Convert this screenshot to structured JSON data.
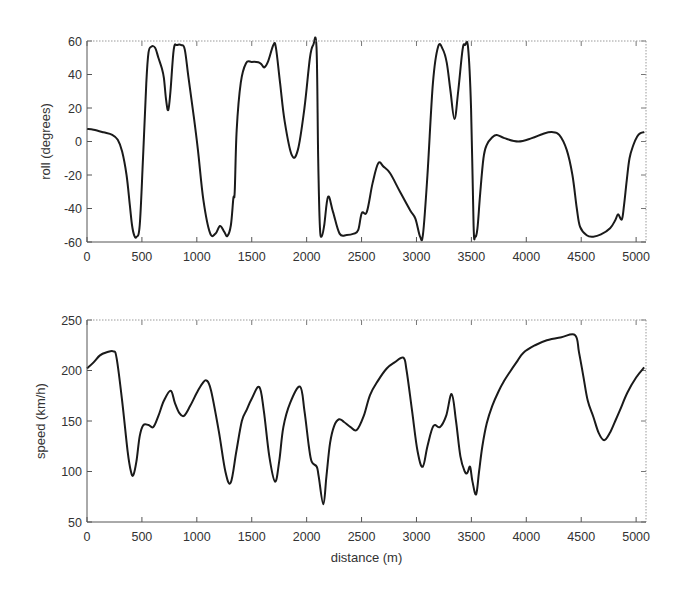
{
  "chart_data": [
    {
      "type": "line",
      "title": "",
      "xlabel": "",
      "ylabel": "roll (degrees)",
      "xlim": [
        0,
        5090
      ],
      "ylim": [
        -60,
        60
      ],
      "xticks": [
        0,
        500,
        1000,
        1500,
        2000,
        2500,
        3000,
        3500,
        4000,
        4500,
        5000
      ],
      "yticks": [
        -60,
        -40,
        -20,
        0,
        20,
        40,
        60
      ],
      "grid": false,
      "legend": null,
      "series": [
        {
          "name": "roll",
          "color": "#1a1a1a",
          "x": [
            0,
            60,
            150,
            230,
            280,
            320,
            360,
            390,
            410,
            430,
            450,
            480,
            510,
            540,
            560,
            585,
            620,
            650,
            680,
            700,
            720,
            740,
            760,
            790,
            820,
            860,
            890,
            923,
            968,
            1010,
            1060,
            1120,
            1170,
            1211,
            1250,
            1278,
            1310,
            1333,
            1345,
            1363,
            1400,
            1448,
            1500,
            1560,
            1590,
            1615,
            1650,
            1697,
            1720,
            1758,
            1800,
            1864,
            1920,
            1980,
            2030,
            2060,
            2090,
            2105,
            2120,
            2137,
            2160,
            2195,
            2240,
            2300,
            2365,
            2430,
            2470,
            2502,
            2548,
            2600,
            2652,
            2700,
            2760,
            2850,
            2942,
            2990,
            3033,
            3060,
            3100,
            3150,
            3197,
            3240,
            3276,
            3310,
            3346,
            3380,
            3420,
            3443,
            3470,
            3497,
            3520,
            3534,
            3555,
            3579,
            3610,
            3640,
            3690,
            3731,
            3800,
            3927,
            4050,
            4150,
            4232,
            4300,
            4368,
            4420,
            4460,
            4490,
            4550,
            4610,
            4680,
            4763,
            4810,
            4836,
            4870,
            4890,
            4915,
            4940,
            4975,
            5010,
            5040,
            5075
          ],
          "y": [
            7.5,
            7,
            5.5,
            4,
            1,
            -6,
            -20,
            -38,
            -50,
            -56,
            -57,
            -50,
            -10,
            35,
            53,
            56.6,
            56,
            50,
            44,
            38,
            25,
            18.8,
            30,
            55,
            57.6,
            57.6,
            55,
            38.7,
            17,
            -5,
            -35,
            -54.6,
            -55,
            -50.4,
            -54,
            -56.4,
            -50,
            -33.7,
            -30,
            6.9,
            35,
            46.7,
            47.5,
            47.3,
            46,
            44.3,
            48,
            57.6,
            56,
            35,
            12,
            -8,
            -5,
            20,
            50,
            57.6,
            56,
            -10,
            -50,
            -56.8,
            -50,
            -33,
            -42,
            -55,
            -55.8,
            -55,
            -52.8,
            -42.8,
            -42,
            -25,
            -13,
            -15,
            -19,
            -30,
            -41,
            -46,
            -56.8,
            -55,
            -20,
            35,
            56.6,
            55,
            46.9,
            30,
            13.4,
            30,
            55,
            57.6,
            56,
            20,
            -50,
            -56.8,
            -52,
            -32,
            -10,
            -2,
            2.5,
            3.9,
            2,
            0,
            2,
            4.5,
            5.6,
            4,
            -5,
            -20,
            -40,
            -51,
            -56,
            -56.8,
            -55.5,
            -51.8,
            -47,
            -43.5,
            -46.5,
            -38,
            -23,
            -10,
            -2.1,
            3,
            5,
            5.6
          ]
        }
      ]
    },
    {
      "type": "line",
      "title": "",
      "xlabel": "distance (m)",
      "ylabel": "speed (km/h)",
      "xlim": [
        0,
        5090
      ],
      "ylim": [
        50,
        250
      ],
      "xticks": [
        0,
        500,
        1000,
        1500,
        2000,
        2500,
        3000,
        3500,
        4000,
        4500,
        5000
      ],
      "yticks": [
        50,
        100,
        150,
        200,
        250
      ],
      "grid": false,
      "legend": null,
      "series": [
        {
          "name": "speed",
          "color": "#1a1a1a",
          "x": [
            0,
            60,
            118,
            180,
            240,
            270,
            320,
            370,
            400,
            422,
            450,
            480,
            513,
            560,
            604,
            650,
            700,
            762,
            800,
            840,
            883,
            940,
            1000,
            1050,
            1090,
            1130,
            1200,
            1260,
            1309,
            1360,
            1410,
            1454,
            1500,
            1569,
            1610,
            1660,
            1712,
            1750,
            1788,
            1850,
            1940,
            1980,
            2020,
            2046,
            2092,
            2110,
            2152,
            2180,
            2213,
            2250,
            2295,
            2340,
            2400,
            2456,
            2520,
            2577,
            2650,
            2729,
            2800,
            2881,
            2910,
            2960,
            3010,
            3057,
            3100,
            3154,
            3215,
            3270,
            3321,
            3360,
            3400,
            3440,
            3464,
            3488,
            3510,
            3543,
            3570,
            3600,
            3640,
            3690,
            3746,
            3800,
            3852,
            3910,
            3974,
            4080,
            4187,
            4320,
            4445,
            4480,
            4520,
            4560,
            4611,
            4660,
            4709,
            4760,
            4810,
            4854,
            4920,
            5000,
            5073
          ],
          "y": [
            202,
            208,
            215,
            218,
            219,
            212,
            170,
            120,
            100,
            96.5,
            110,
            135,
            146,
            146,
            144,
            155,
            170,
            180,
            168,
            158,
            155,
            165,
            178,
            187,
            190,
            180,
            140,
            100,
            89,
            120,
            150,
            161,
            172,
            183.6,
            160,
            115,
            90,
            110,
            144,
            168,
            184,
            160,
            125,
            109.7,
            104.7,
            95,
            67.5,
            95,
            128,
            145,
            151.7,
            149,
            144,
            141,
            155,
            175.7,
            190,
            202,
            208,
            212.7,
            200,
            160,
            120,
            104.7,
            125,
            145,
            144,
            155,
            176.7,
            150,
            115,
            100,
            98.8,
            104.7,
            90,
            77.4,
            100,
            125,
            147.7,
            165,
            179,
            190,
            198.8,
            208,
            217.6,
            225,
            230,
            233,
            235,
            218,
            194,
            170,
            154,
            138,
            131,
            138,
            150,
            161,
            178,
            193,
            203
          ]
        }
      ]
    }
  ]
}
